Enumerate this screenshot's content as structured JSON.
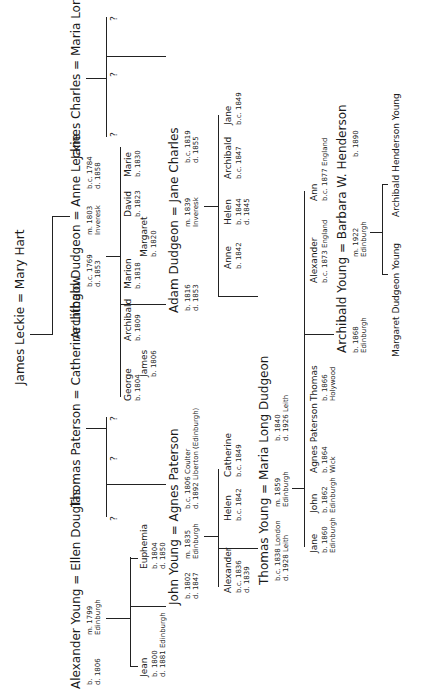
{
  "document": {
    "title": "Family tree (handwritten, rotated)",
    "orientation": "rotated 90 degrees counter-clockwise"
  },
  "top_couple": {
    "husband": "James Leckie",
    "wife": "Mary Hart"
  },
  "generation1": [
    {
      "husband": "Alexander Young",
      "husband_dates": "b.\nd. 1806",
      "wife": "Ellen Douglas",
      "marriage": "m. 1799\nEdinburgh"
    },
    {
      "husband": "Thomas Paterson",
      "wife": "Catherine Lithgow"
    },
    {
      "husband": "Archibald Dudgeon",
      "husband_dates": "b.c. 1769\nd. 1853",
      "wife": "Anne Leckie",
      "wife_dates": "b.c. 1784\nd. 1858",
      "marriage": "m. 1803\nInveresk"
    },
    {
      "husband": "James Charles",
      "wife": "Maria Long"
    }
  ],
  "young_children": [
    {
      "name": "Jean",
      "dates": "b. 1800\nd. 1881 Edinburgh"
    },
    {
      "name": "John Young",
      "dates": "b. 1802\nd. 1847"
    },
    {
      "name": "Euphemia",
      "dates": "b. 1804\nd. 1850"
    }
  ],
  "paterson_children": [
    "?",
    "?",
    "?"
  ],
  "dudgeon_children": [
    {
      "name": "George",
      "dates": "b. 1804"
    },
    {
      "name": "James",
      "dates": "b. 1806"
    },
    {
      "name": "Archibald",
      "dates": "b. 1809"
    },
    {
      "name": "Marion",
      "dates": "b. 1818"
    },
    {
      "name": "Margaret",
      "dates": "b. 1820"
    },
    {
      "name": "Adam Dudgeon",
      "dates": "b. 1816\nd. 1853"
    },
    {
      "name": "David",
      "dates": "b. 1823"
    },
    {
      "name": "Marie",
      "dates": "b. 1830"
    }
  ],
  "charles_children": [
    "?",
    "?",
    "?"
  ],
  "generation2": [
    {
      "husband": "John Young",
      "wife": "Agnes Paterson",
      "wife_dates": "b.c. 1806 Coulter\nd. 1892 Liberton (Edinburgh)",
      "marriage": "m. 1835\nEdinburgh"
    },
    {
      "husband": "Adam Dudgeon",
      "wife": "Jane Charles",
      "wife_dates": "b.c. 1819\nd. 1855",
      "marriage": "m. 1839\nInveresk"
    }
  ],
  "john_agnes_children": [
    {
      "name": "Alexander",
      "dates": "b.c. 1836\nd. 1839"
    },
    {
      "name": "Thomas Young",
      "dates": "b.c. 1838 London\nd. 1928 Leith"
    },
    {
      "name": "Helen",
      "dates": "b.c. 1842"
    },
    {
      "name": "Catherine",
      "dates": "b.c. 1849"
    }
  ],
  "adam_jane_children": [
    {
      "name": "Maria Long Dudgeon",
      "dates": "b. 1840\nd. 1926 Leith"
    },
    {
      "name": "Anne",
      "dates": "b. 1842"
    },
    {
      "name": "Helen",
      "dates": "b. 1844\nd. 1845"
    },
    {
      "name": "Archibald",
      "dates": "b.c. 1847"
    },
    {
      "name": "Jane",
      "dates": "b.c. 1849"
    }
  ],
  "generation3": {
    "husband": "Thomas Young",
    "wife": "Maria Long Dudgeon",
    "marriage": "m. 1859\nEdinburgh"
  },
  "thomas_maria_children": [
    {
      "name": "Jane",
      "dates": "b. 1860\nEdinburgh"
    },
    {
      "name": "John",
      "dates": "b. 1862\nEdinburgh"
    },
    {
      "name": "Agnes Paterson",
      "dates": "b. 1864\nWick"
    },
    {
      "name": "Thomas",
      "dates": "b. 1866\nHolywood"
    },
    {
      "name": "Archibald Young",
      "dates": "b. 1868\nEdinburgh"
    },
    {
      "name": "Alexander",
      "dates": "b.c. 1873 England"
    },
    {
      "name": "Ann",
      "dates": "b.c. 1877 England"
    }
  ],
  "generation4": {
    "husband": "Archibald Young",
    "husband_dates": "b. 1868\nEdinburgh",
    "wife": "Barbara W. Henderson",
    "wife_dates": "b. 1890",
    "marriage": "m. 1922\nEdinburgh"
  },
  "archibald_barbara_children": [
    {
      "name": "Margaret Dudgeon Young"
    },
    {
      "name": "Archibald Henderson Young"
    }
  ],
  "symbols": {
    "equals": "=",
    "unknown": "?"
  }
}
